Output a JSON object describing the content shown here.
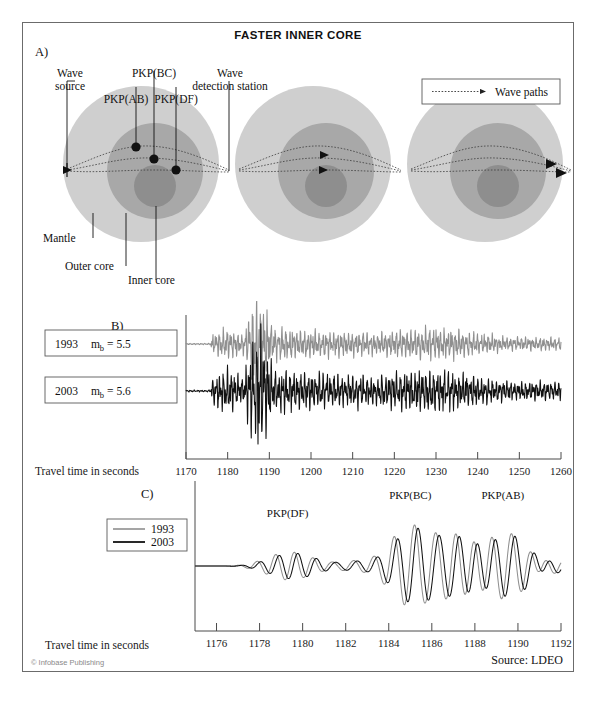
{
  "figure": {
    "title": "FASTER INNER CORE",
    "frame_color": "#6b6b6b"
  },
  "panels": {
    "a": {
      "letter": "A)",
      "labels": {
        "wave_source_line1": "Wave",
        "wave_source_line2": "source",
        "pkp_ab": "PKP(AB)",
        "pkp_bc": "PKP(BC)",
        "pkp_df": "PKP(DF)",
        "station_line1": "Wave",
        "station_line2": "detection station",
        "mantle": "Mantle",
        "outer_core": "Outer core",
        "inner_core": "Inner core"
      },
      "legend": {
        "wave_paths": "Wave paths"
      },
      "colors": {
        "mantle": "#cfcfcf",
        "outer_core": "#a8a8a8",
        "inner_core": "#8e8e8e",
        "marker": "#111111"
      }
    },
    "b": {
      "letter": "B)",
      "trace_labels": [
        {
          "year": "1993",
          "mag_prefix": "m",
          "mag_sub": "b",
          "mag_value": "= 5.5"
        },
        {
          "year": "2003",
          "mag_prefix": "m",
          "mag_sub": "b",
          "mag_value": "= 5.6"
        }
      ],
      "axis_caption": "Travel time in seconds"
    },
    "c": {
      "letter": "C)",
      "legend": [
        {
          "label": "1993",
          "color": "#8f8f8f"
        },
        {
          "label": "2003",
          "color": "#111111"
        }
      ],
      "phase_labels": [
        "PKP(DF)",
        "PKP(BC)",
        "PKP(AB)"
      ],
      "axis_caption": "Travel time in seconds"
    }
  },
  "footer": {
    "copyright": "© Infobase Publishing",
    "source": "Source: LDEO"
  },
  "chart_data": [
    {
      "type": "line",
      "id": "panel-b-seismograms",
      "title": "B) Seismograms recorded 1993 and 2003",
      "xlabel": "Travel time in seconds",
      "ylabel": "",
      "xlim": [
        1170,
        1260
      ],
      "xticks": [
        1170,
        1180,
        1190,
        1200,
        1210,
        1220,
        1230,
        1240,
        1250,
        1260
      ],
      "xticklabels": [
        "1170",
        "1180",
        "1190",
        "1200",
        "1210",
        "1220",
        "1230",
        "1240",
        "1250",
        "1260"
      ],
      "grid": false,
      "legend_position": "left-outside",
      "series": [
        {
          "name": "1993  m_b = 5.5",
          "color": "#8f8f8f"
        },
        {
          "name": "2003  m_b = 5.6",
          "color": "#111111"
        }
      ],
      "annotations": [
        "Largest amplitudes arrive near 1185-1190 s in both records"
      ]
    },
    {
      "type": "line",
      "id": "panel-c-waveform-comparison",
      "title": "C) Enlarged PKP arrivals, 1993 vs 2003",
      "xlabel": "Travel time in seconds",
      "ylabel": "",
      "xlim": [
        1175,
        1192
      ],
      "xticks": [
        1176,
        1178,
        1180,
        1182,
        1184,
        1186,
        1188,
        1190,
        1192
      ],
      "xticklabels": [
        "1176",
        "1178",
        "1180",
        "1182",
        "1184",
        "1186",
        "1188",
        "1190",
        "1192"
      ],
      "grid": false,
      "legend_position": "left-outside",
      "series": [
        {
          "name": "1993",
          "color": "#8f8f8f"
        },
        {
          "name": "2003",
          "color": "#111111"
        }
      ],
      "annotations": [
        {
          "text": "PKP(DF)",
          "x": 1179.3
        },
        {
          "text": "PKP(BC)",
          "x": 1185.0
        },
        {
          "text": "PKP(AB)",
          "x": 1189.3
        }
      ]
    }
  ]
}
